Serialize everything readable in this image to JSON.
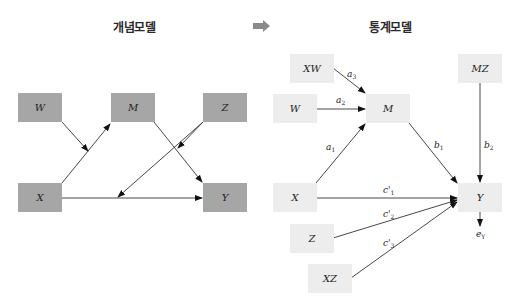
{
  "left_panel": {
    "title": "개념모델",
    "nodes": [
      {
        "id": "W",
        "label": "W"
      },
      {
        "id": "M",
        "label": "M"
      },
      {
        "id": "Z",
        "label": "Z"
      },
      {
        "id": "X",
        "label": "X"
      },
      {
        "id": "Y",
        "label": "Y"
      }
    ],
    "edges": [
      {
        "from": "X",
        "to": "M"
      },
      {
        "from": "W",
        "to": "X→M"
      },
      {
        "from": "M",
        "to": "Y"
      },
      {
        "from": "Z",
        "to": "M→Y"
      },
      {
        "from": "Z",
        "to": "X→Y"
      },
      {
        "from": "X",
        "to": "Y"
      }
    ],
    "box_color": "#a6a6a6"
  },
  "transition_arrow": "right-arrow-icon",
  "right_panel": {
    "title": "통계모델",
    "nodes": [
      {
        "id": "XW",
        "label": "XW"
      },
      {
        "id": "W",
        "label": "W"
      },
      {
        "id": "M",
        "label": "M"
      },
      {
        "id": "MZ",
        "label": "MZ"
      },
      {
        "id": "X",
        "label": "X"
      },
      {
        "id": "Y",
        "label": "Y"
      },
      {
        "id": "Z",
        "label": "Z"
      },
      {
        "id": "XZ",
        "label": "XZ"
      }
    ],
    "edges": [
      {
        "from": "XW",
        "to": "M",
        "coef": "a",
        "sub": "3"
      },
      {
        "from": "W",
        "to": "M",
        "coef": "a",
        "sub": "2"
      },
      {
        "from": "X",
        "to": "M",
        "coef": "a",
        "sub": "1"
      },
      {
        "from": "M",
        "to": "Y",
        "coef": "b",
        "sub": "1"
      },
      {
        "from": "MZ",
        "to": "Y",
        "coef": "b",
        "sub": "2"
      },
      {
        "from": "X",
        "to": "Y",
        "coef": "c'",
        "sub": "1"
      },
      {
        "from": "Z",
        "to": "Y",
        "coef": "c'",
        "sub": "2"
      },
      {
        "from": "XZ",
        "to": "Y",
        "coef": "c'",
        "sub": "3"
      }
    ],
    "error_term": {
      "label": "e",
      "sub": "Y"
    },
    "box_color": "#ededed"
  }
}
